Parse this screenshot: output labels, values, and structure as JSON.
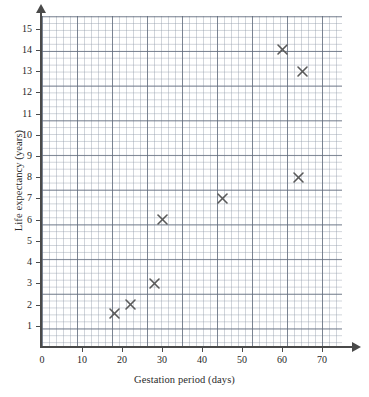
{
  "chart_data": {
    "type": "scatter",
    "title": "",
    "xlabel": "Gestation period (days)",
    "ylabel": "Life expectancy (years)",
    "xlim": [
      0,
      75
    ],
    "ylim": [
      0,
      15.6
    ],
    "grid": "on",
    "legend": "none",
    "marker_style": "x-cross",
    "marker_color": "#5a5a5a",
    "x_ticks": [
      0,
      10,
      20,
      30,
      40,
      50,
      60,
      70
    ],
    "y_ticks": [
      1,
      2,
      3,
      4,
      5,
      6,
      7,
      8,
      9,
      10,
      11,
      12,
      13,
      14,
      15
    ],
    "x": [
      18,
      22,
      28,
      30,
      45,
      60,
      64,
      65
    ],
    "y": [
      1.6,
      2,
      3,
      6,
      7,
      14,
      8,
      13
    ],
    "points": [
      {
        "x": 18,
        "y": 1.6
      },
      {
        "x": 22,
        "y": 2
      },
      {
        "x": 28,
        "y": 3
      },
      {
        "x": 30,
        "y": 6
      },
      {
        "x": 45,
        "y": 7
      },
      {
        "x": 60,
        "y": 14
      },
      {
        "x": 64,
        "y": 8
      },
      {
        "x": 65,
        "y": 13
      }
    ]
  },
  "axes": {
    "x_title": "Gestation period (days)",
    "y_title": "Life expectancy (years)",
    "origin_label": "0"
  },
  "colors": {
    "grid_minor": "#8c96a5",
    "grid_major": "#5f697a",
    "axis": "#4a4a4a",
    "marker": "#5a5a5a",
    "text": "#1f1f1f"
  }
}
